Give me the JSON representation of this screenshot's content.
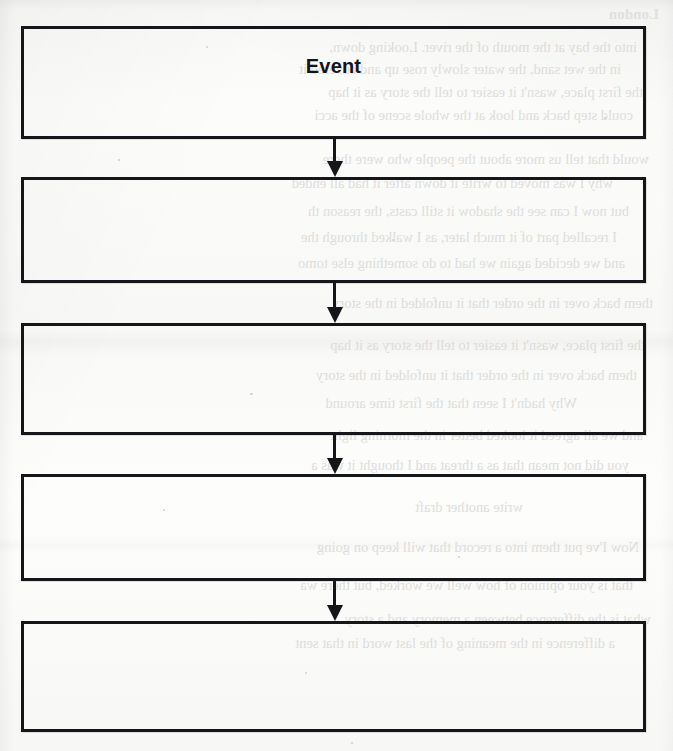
{
  "document": {
    "type": "scanned-worksheet",
    "paper_color": "#fbfbfa",
    "ink_color": "#15161a"
  },
  "flowchart": {
    "type": "vertical-sequence",
    "box_count": 5,
    "arrow_count": 4,
    "boxes": [
      {
        "id": "box-1",
        "label": "Event",
        "filled": true
      },
      {
        "id": "box-2",
        "label": "",
        "filled": false
      },
      {
        "id": "box-3",
        "label": "",
        "filled": false
      },
      {
        "id": "box-4",
        "label": "",
        "filled": false
      },
      {
        "id": "box-5",
        "label": "",
        "filled": false
      }
    ],
    "arrows": [
      {
        "id": "arrow-1",
        "direction": "down"
      },
      {
        "id": "arrow-2",
        "direction": "down"
      },
      {
        "id": "arrow-3",
        "direction": "down"
      },
      {
        "id": "arrow-4",
        "direction": "down"
      }
    ]
  },
  "bleed_through": {
    "note": "faint mirrored show-through text from the reverse side of the sheet",
    "color": "#d9d9d6",
    "heading": "London",
    "lines": [
      "into the bay at the mouth of the river. Looking down,",
      "in the wet sand, the water slowly rose up and covered it",
      "the first place, wasn't it easier to tell the story as it hap",
      "could step back and look at the whole scene of the acci",
      "would that tell us more about the people who were there",
      "why I was moved to write it down after it had all ended",
      "but now I can see the shadow it still casts, the reason th",
      "I recalled part of it much later, as I walked through the",
      "and we decided again we had to do something else tomo",
      "them back over in the order that it unfolded in the story",
      "Why hadn't I seen that the first time around",
      "and we all agreed it looked better in the morning light",
      "you did not mean that as a threat and I thought it was a",
      "that is your opinion of how well we worked, but there wa",
      "a difference in the meaning of the last word in that sent",
      "Now I've put them into a record that will keep on going",
      "what is the difference between a memory and a story",
      "write another draft"
    ]
  }
}
